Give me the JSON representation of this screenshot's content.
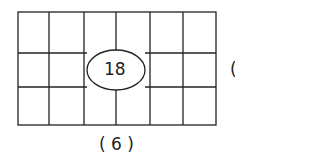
{
  "diagram": {
    "grid": {
      "columns": 6,
      "rows": 3
    },
    "center_value": "18",
    "caption": "( 6 )",
    "edge_fragment": "("
  }
}
